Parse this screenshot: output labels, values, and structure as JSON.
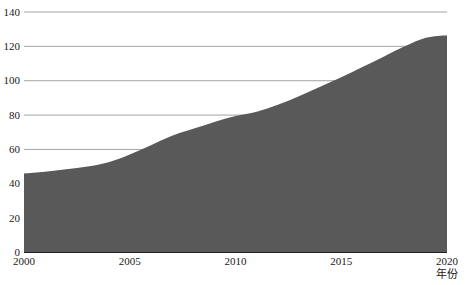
{
  "chart_data": {
    "type": "area",
    "title": "",
    "subtitle": "",
    "xlabel": "年份",
    "ylabel": "",
    "xlim": [
      2000,
      2020
    ],
    "ylim": [
      0,
      140
    ],
    "grid": true,
    "legend": null,
    "legend_position": "none",
    "series_color": "#595959",
    "x_tick_labels": [
      "2000",
      "2005",
      "2010",
      "2015",
      "2020"
    ],
    "x_tick_values": [
      2000,
      2005,
      2010,
      2015,
      2020
    ],
    "y_tick_labels": [
      "0",
      "20",
      "40",
      "60",
      "80",
      "100",
      "120",
      "140"
    ],
    "y_tick_values": [
      0,
      20,
      40,
      60,
      80,
      100,
      120,
      140
    ],
    "x": [
      2000,
      2001,
      2002,
      2003,
      2004,
      2005,
      2006,
      2007,
      2008,
      2009,
      2010,
      2011,
      2012,
      2013,
      2014,
      2015,
      2016,
      2017,
      2018,
      2019,
      2020
    ],
    "series": [
      {
        "name": "value",
        "values": [
          46,
          47,
          48.5,
          50,
          52.5,
          57,
          62.5,
          68,
          72,
          76,
          79.5,
          82,
          86,
          91,
          96.5,
          102,
          108,
          114,
          120,
          125,
          126.5
        ]
      }
    ]
  },
  "axis": {
    "x_axis_name": "x-axis",
    "y_axis_name": "y-axis"
  }
}
